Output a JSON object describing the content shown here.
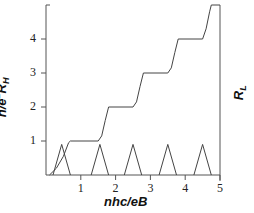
{
  "chart_data": {
    "type": "line",
    "title": "",
    "xlabel": "nhc/eB",
    "ylabel": "h/e²R_H",
    "ylabel_right": "R_L",
    "xlim": [
      0,
      5
    ],
    "ylim": [
      0,
      5
    ],
    "x_ticks": [
      "1",
      "2",
      "3",
      "4",
      "5"
    ],
    "y_ticks": [
      "1",
      "2",
      "3",
      "4"
    ],
    "grid": false,
    "legend": null,
    "series": [
      {
        "name": "h/e²R_H (Hall resistance, quantized plateaus)",
        "x": [
          0.1,
          0.3,
          0.5,
          0.65,
          0.7,
          1.5,
          1.6,
          1.7,
          1.8,
          2.5,
          2.6,
          2.7,
          2.8,
          3.5,
          3.6,
          3.7,
          3.8,
          4.5,
          4.6,
          4.7,
          4.75,
          5.0
        ],
        "y": [
          0.0,
          0.2,
          0.55,
          0.95,
          1.0,
          1.0,
          1.15,
          1.6,
          2.0,
          2.0,
          2.15,
          2.6,
          3.0,
          3.0,
          3.15,
          3.6,
          4.0,
          4.0,
          4.3,
          4.8,
          5.0,
          5.0
        ]
      },
      {
        "name": "R_L (longitudinal resistance peaks)",
        "peaks": [
          {
            "center": 0.45,
            "height": 0.9,
            "half_width": 0.25
          },
          {
            "center": 1.55,
            "height": 0.9,
            "half_width": 0.25
          },
          {
            "center": 2.5,
            "height": 0.9,
            "half_width": 0.25
          },
          {
            "center": 3.5,
            "height": 0.9,
            "half_width": 0.25
          },
          {
            "center": 4.5,
            "height": 0.9,
            "half_width": 0.25
          }
        ]
      }
    ]
  },
  "labels": {
    "xlabel": "nhc/eB",
    "ylabel_main": "h/e",
    "ylabel_sup": "2",
    "ylabel_r": "R",
    "ylabel_sub": "H",
    "rlabel_r": "R",
    "rlabel_sub": "L",
    "xticks": [
      "1",
      "2",
      "3",
      "4",
      "5"
    ],
    "yticks": [
      "1",
      "2",
      "3",
      "4"
    ]
  },
  "colors": {
    "line": "#444444",
    "axis": "#555555"
  }
}
